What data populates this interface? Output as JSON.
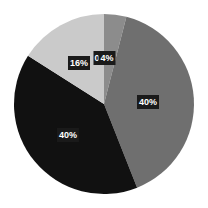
{
  "chart_data": {
    "type": "pie",
    "title": "",
    "categories": [
      "Slice A",
      "Slice B",
      "Slice C",
      "Slice D",
      "Slice E"
    ],
    "values": [
      0,
      4,
      40,
      40,
      16
    ],
    "labels": [
      "0%",
      "4%",
      "40%",
      "40%",
      "16%"
    ],
    "colors": [
      "#9a9a9a",
      "#8c8c8c",
      "#6f6f6f",
      "#111111",
      "#cacaca"
    ],
    "start_angle_deg": 0,
    "direction": "clockwise",
    "legend": "none"
  },
  "labels": {
    "zero": "0",
    "small": "4%",
    "right": "40%",
    "left": "40%",
    "light": "16%"
  }
}
